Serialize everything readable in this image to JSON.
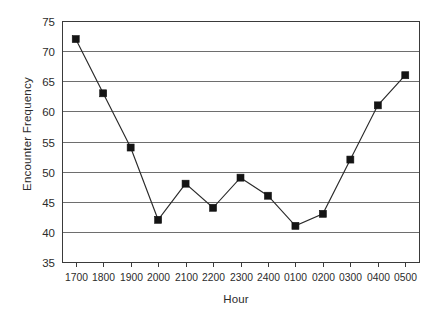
{
  "chart_data": {
    "type": "line",
    "title": "",
    "xlabel": "Hour",
    "ylabel": "Encounter Frequency",
    "categories": [
      "1700",
      "1800",
      "1900",
      "2000",
      "2100",
      "2200",
      "2300",
      "2400",
      "0100",
      "0200",
      "0300",
      "0400",
      "0500"
    ],
    "values": [
      72,
      63,
      54,
      42,
      48,
      44,
      49,
      46,
      41,
      43,
      52,
      61,
      66
    ],
    "ylim": [
      35,
      75
    ],
    "yticks": [
      35,
      40,
      45,
      50,
      55,
      60,
      65,
      70,
      75
    ],
    "ytick_labels": [
      "35",
      "40",
      "45",
      "50",
      "55",
      "60",
      "65",
      "70",
      "75"
    ],
    "grid": "horizontal",
    "legend": "none",
    "marker": "filled-square",
    "line_color": "#2a2a2a",
    "marker_color": "#141414",
    "gridline_color": "#6e6e6e",
    "border_color": "#3a3a3a",
    "background_color": "#ffffff"
  }
}
